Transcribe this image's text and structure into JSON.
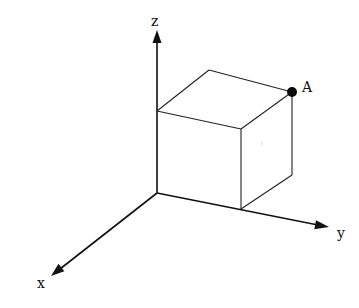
{
  "diagram": {
    "axes": {
      "z": {
        "label": "z",
        "from": [
          157,
          193
        ],
        "to": [
          157,
          30
        ]
      },
      "y": {
        "label": "y",
        "from": [
          157,
          193
        ],
        "to": [
          328,
          227
        ]
      },
      "x": {
        "label": "x",
        "from": [
          157,
          193
        ],
        "to": [
          52,
          275
        ]
      }
    },
    "origin": [
      157,
      193
    ],
    "cube": {
      "vertices": {
        "origin": [
          157,
          193
        ],
        "z_top": [
          157,
          111
        ],
        "back_top": [
          209,
          70
        ],
        "A": [
          292,
          92
        ],
        "front_top_right": [
          241,
          129
        ],
        "front_bottom_right": [
          241,
          209
        ],
        "back_bottom_right": [
          292,
          175
        ]
      }
    },
    "points": [
      {
        "name": "A",
        "label": "A",
        "position": [
          292,
          92
        ]
      }
    ],
    "colors": {
      "line": "#111111",
      "background": "#ffffff"
    }
  }
}
